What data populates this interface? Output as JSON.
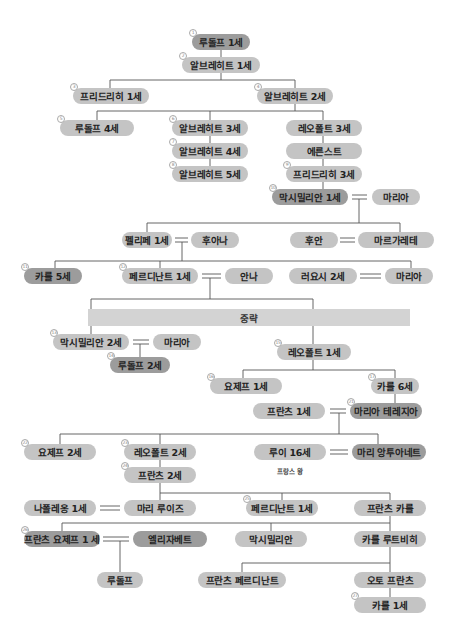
{
  "diagram": {
    "type": "family-tree",
    "banner": "중략",
    "note": "프랑스 왕",
    "nodes": [
      {
        "id": "n1",
        "badge": "1",
        "label": "루돌프 1세",
        "x": 192,
        "y": 34,
        "w": 58,
        "style": "dark"
      },
      {
        "id": "n2",
        "badge": "2",
        "label": "알브레히트 1세",
        "x": 182,
        "y": 57,
        "w": 78,
        "style": "normal"
      },
      {
        "id": "n3",
        "badge": "3",
        "label": "프리드리히 1세",
        "x": 73,
        "y": 88,
        "w": 76,
        "style": "normal"
      },
      {
        "id": "n4",
        "badge": "4",
        "label": "알브레히트 2세",
        "x": 257,
        "y": 88,
        "w": 76,
        "style": "normal"
      },
      {
        "id": "n5",
        "badge": "5",
        "label": "루돌프 4세",
        "x": 60,
        "y": 120,
        "w": 74,
        "style": "normal"
      },
      {
        "id": "n6",
        "badge": "6",
        "label": "알브레히트 3세",
        "x": 172,
        "y": 120,
        "w": 76,
        "style": "normal"
      },
      {
        "id": "n7",
        "badge": "7",
        "label": "알브레히트 4세",
        "x": 172,
        "y": 143,
        "w": 76,
        "style": "normal"
      },
      {
        "id": "n8",
        "badge": "8",
        "label": "알브레히트 5세",
        "x": 172,
        "y": 166,
        "w": 76,
        "style": "normal"
      },
      {
        "id": "n9",
        "label": "레오폴트 3세",
        "x": 286,
        "y": 120,
        "w": 76,
        "style": "normal"
      },
      {
        "id": "n10",
        "label": "에른스트",
        "x": 286,
        "y": 143,
        "w": 76,
        "style": "normal"
      },
      {
        "id": "n11",
        "badge": "9",
        "label": "프리드리히 3세",
        "x": 286,
        "y": 166,
        "w": 76,
        "style": "normal"
      },
      {
        "id": "n12",
        "badge": "10",
        "label": "막시밀리안 1세",
        "x": 272,
        "y": 189,
        "w": 76,
        "style": "dark"
      },
      {
        "id": "n13",
        "label": "마리아",
        "x": 372,
        "y": 189,
        "w": 48,
        "style": "normal"
      },
      {
        "id": "n14",
        "label": "펠리페 1세",
        "x": 122,
        "y": 232,
        "w": 50,
        "style": "normal"
      },
      {
        "id": "n15",
        "label": "후아나",
        "x": 191,
        "y": 232,
        "w": 48,
        "style": "normal"
      },
      {
        "id": "n16",
        "label": "후안",
        "x": 290,
        "y": 232,
        "w": 48,
        "style": "normal"
      },
      {
        "id": "n17",
        "label": "마르가레테",
        "x": 358,
        "y": 232,
        "w": 76,
        "style": "normal"
      },
      {
        "id": "n18",
        "badge": "11",
        "label": "카를 5세",
        "x": 24,
        "y": 268,
        "w": 58,
        "style": "dark"
      },
      {
        "id": "n19",
        "badge": "12",
        "label": "페르디난트 1세",
        "x": 122,
        "y": 268,
        "w": 76,
        "style": "normal"
      },
      {
        "id": "n20",
        "label": "안나",
        "x": 225,
        "y": 268,
        "w": 48,
        "style": "normal"
      },
      {
        "id": "n21",
        "label": "러요시 2세",
        "x": 289,
        "y": 268,
        "w": 68,
        "style": "normal"
      },
      {
        "id": "n22",
        "label": "마리아",
        "x": 385,
        "y": 268,
        "w": 48,
        "style": "normal"
      },
      {
        "id": "n23",
        "badge": "13",
        "label": "막시밀리안 2세",
        "x": 53,
        "y": 334,
        "w": 76,
        "style": "normal"
      },
      {
        "id": "n24",
        "label": "마리아",
        "x": 153,
        "y": 334,
        "w": 48,
        "style": "normal"
      },
      {
        "id": "n25",
        "badge": "14",
        "label": "루돌프 2세",
        "x": 110,
        "y": 357,
        "w": 60,
        "style": "dark"
      },
      {
        "id": "n26",
        "badge": "15",
        "label": "레오폴트 1세",
        "x": 277,
        "y": 344,
        "w": 74,
        "style": "normal"
      },
      {
        "id": "n27",
        "badge": "16",
        "label": "요제프 1세",
        "x": 210,
        "y": 378,
        "w": 72,
        "style": "normal"
      },
      {
        "id": "n28",
        "badge": "17",
        "label": "카를 6세",
        "x": 371,
        "y": 378,
        "w": 48,
        "style": "normal"
      },
      {
        "id": "n29",
        "label": "프란츠 1세",
        "x": 253,
        "y": 403,
        "w": 72,
        "style": "normal"
      },
      {
        "id": "n30",
        "badge": "21",
        "label": "마리아 테레지아",
        "x": 350,
        "y": 403,
        "w": 72,
        "style": "dark"
      },
      {
        "id": "n31",
        "badge": "22",
        "label": "요제프 2세",
        "x": 24,
        "y": 444,
        "w": 72,
        "style": "normal"
      },
      {
        "id": "n32",
        "badge": "23",
        "label": "레오폴트 2세",
        "x": 124,
        "y": 444,
        "w": 72,
        "style": "normal"
      },
      {
        "id": "n33",
        "label": "루이 16세",
        "x": 254,
        "y": 444,
        "w": 72,
        "style": "normal"
      },
      {
        "id": "n34",
        "label": "마리 앙투아네트",
        "x": 352,
        "y": 444,
        "w": 74,
        "style": "dark"
      },
      {
        "id": "n35",
        "badge": "24",
        "label": "프란츠 2세",
        "x": 124,
        "y": 467,
        "w": 72,
        "style": "normal"
      },
      {
        "id": "n36",
        "label": "나폴레옹 1세",
        "x": 24,
        "y": 500,
        "w": 72,
        "style": "normal"
      },
      {
        "id": "n37",
        "label": "마리 루이즈",
        "x": 124,
        "y": 500,
        "w": 72,
        "style": "normal"
      },
      {
        "id": "n38",
        "badge": "25",
        "label": "페르디난트 1세",
        "x": 246,
        "y": 500,
        "w": 72,
        "style": "normal"
      },
      {
        "id": "n39",
        "label": "프란츠 카를",
        "x": 354,
        "y": 500,
        "w": 72,
        "style": "normal"
      },
      {
        "id": "n40",
        "badge": "26",
        "label": "프란츠 요제프 1 세",
        "x": 24,
        "y": 531,
        "w": 76,
        "style": "dark"
      },
      {
        "id": "n41",
        "label": "엘리자베트",
        "x": 133,
        "y": 531,
        "w": 74,
        "style": "dark"
      },
      {
        "id": "n42",
        "label": "막시밀리안",
        "x": 235,
        "y": 531,
        "w": 72,
        "style": "normal"
      },
      {
        "id": "n43",
        "label": "카를 루트비히",
        "x": 354,
        "y": 531,
        "w": 72,
        "style": "normal"
      },
      {
        "id": "n44",
        "label": "루돌프",
        "x": 97,
        "y": 572,
        "w": 46,
        "style": "normal"
      },
      {
        "id": "n45",
        "label": "프란츠 페르디난트",
        "x": 198,
        "y": 572,
        "w": 88,
        "style": "normal"
      },
      {
        "id": "n46",
        "label": "오토 프란츠",
        "x": 354,
        "y": 572,
        "w": 72,
        "style": "normal"
      },
      {
        "id": "n47",
        "badge": "27",
        "label": "카를 1세",
        "x": 354,
        "y": 597,
        "w": 72,
        "style": "normal"
      }
    ]
  }
}
